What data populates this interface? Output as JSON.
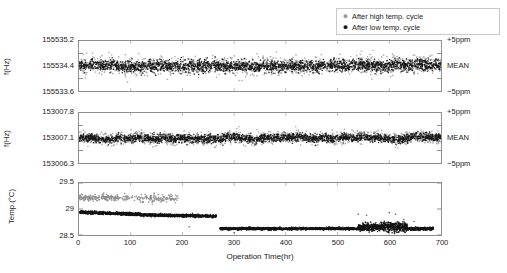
{
  "legend": {
    "position": "top-right",
    "entries": [
      {
        "marker": "dot-icon",
        "color": "#9a9a9a",
        "label": "After high temp. cycle"
      },
      {
        "marker": "dot-icon",
        "color": "#141414",
        "label": "After low temp. cycle"
      }
    ]
  },
  "axis": {
    "xlabel": "Operation Time(hr)",
    "xticks": [
      "0",
      "100",
      "200",
      "300",
      "400",
      "500",
      "600",
      "700"
    ],
    "xlim": [
      0,
      700
    ]
  },
  "panels": {
    "top": {
      "ylabel": "f(Hz)",
      "yticks": [
        "155535.2",
        "155534.4",
        "155533.6"
      ],
      "right_labels": [
        "+5ppm",
        "MEAN",
        "−5ppm"
      ]
    },
    "middle": {
      "ylabel": "f(Hz)",
      "yticks": [
        "153007.8",
        "153007.1",
        "153006.3"
      ],
      "right_labels": [
        "+5ppm",
        "MEAN",
        "−5ppm"
      ]
    },
    "bottom": {
      "ylabel": "Temp.(°C)",
      "yticks": [
        "29.5",
        "29",
        "28.5"
      ],
      "right_labels": []
    }
  },
  "chart_data": [
    {
      "type": "scatter",
      "id": "frequency-155534",
      "title": "",
      "xlabel": "Operation Time(hr)",
      "ylabel": "f(Hz)",
      "xlim": [
        0,
        700
      ],
      "ylim": [
        155533.6,
        155535.2
      ],
      "yticks": [
        155533.6,
        155534.4,
        155535.2
      ],
      "ytick_labels": [
        "155533.6",
        "155534.4",
        "155535.2"
      ],
      "right_axis_labels": [
        "−5ppm",
        "MEAN",
        "+5ppm"
      ],
      "grid": false,
      "mean": 155534.4,
      "noise_amplitude_hz": 0.2,
      "series": [
        {
          "name": "After high temp. cycle",
          "color": "#9a9a9a",
          "center": 155534.42,
          "spread": 0.2
        },
        {
          "name": "After low temp. cycle",
          "color": "#141414",
          "center": 155534.4,
          "spread": 0.14
        }
      ]
    },
    {
      "type": "scatter",
      "id": "frequency-153007",
      "title": "",
      "xlabel": "Operation Time(hr)",
      "ylabel": "f(Hz)",
      "xlim": [
        0,
        700
      ],
      "ylim": [
        153006.3,
        153007.8
      ],
      "yticks": [
        153006.3,
        153007.1,
        153007.8
      ],
      "ytick_labels": [
        "153006.3",
        "153007.1",
        "153007.8"
      ],
      "right_axis_labels": [
        "−5ppm",
        "MEAN",
        "+5ppm"
      ],
      "grid": false,
      "mean": 153007.1,
      "noise_amplitude_hz": 0.12,
      "series": [
        {
          "name": "After high temp. cycle",
          "color": "#9a9a9a",
          "center": 153007.13,
          "spread": 0.13
        },
        {
          "name": "After low temp. cycle",
          "color": "#141414",
          "center": 153007.1,
          "spread": 0.09
        }
      ]
    },
    {
      "type": "scatter",
      "id": "temperature",
      "title": "",
      "xlabel": "Operation Time(hr)",
      "ylabel": "Temp.(°C)",
      "xlim": [
        0,
        700
      ],
      "ylim": [
        28.5,
        29.5
      ],
      "yticks": [
        28.5,
        29.0,
        29.5
      ],
      "ytick_labels": [
        "28.5",
        "29",
        "29.5"
      ],
      "grid": false,
      "series": [
        {
          "name": "After high temp. cycle",
          "color": "#9a9a9a",
          "description": "sparse cluster near 29.2 from 0 to ~190 hr, fading out",
          "segments": [
            {
              "x_start": 0,
              "x_end": 100,
              "y": 29.22
            },
            {
              "x_start": 100,
              "x_end": 190,
              "y": 29.2
            }
          ]
        },
        {
          "name": "After low temp. cycle",
          "color": "#141414",
          "description": "plateau ~28.93 decaying to 28.85 until 265 hr, step down to 28.62, noise burst 540-630 hr",
          "segments": [
            {
              "x_start": 0,
              "x_end": 120,
              "y_start": 28.94,
              "y_end": 28.9
            },
            {
              "x_start": 120,
              "x_end": 265,
              "y_start": 28.88,
              "y_end": 28.86
            },
            {
              "x_start": 272,
              "x_end": 540,
              "y": 28.62
            },
            {
              "x_start": 540,
              "x_end": 635,
              "y": 28.66,
              "noise": 0.09
            },
            {
              "x_start": 635,
              "x_end": 685,
              "y": 28.62
            }
          ]
        }
      ]
    }
  ]
}
